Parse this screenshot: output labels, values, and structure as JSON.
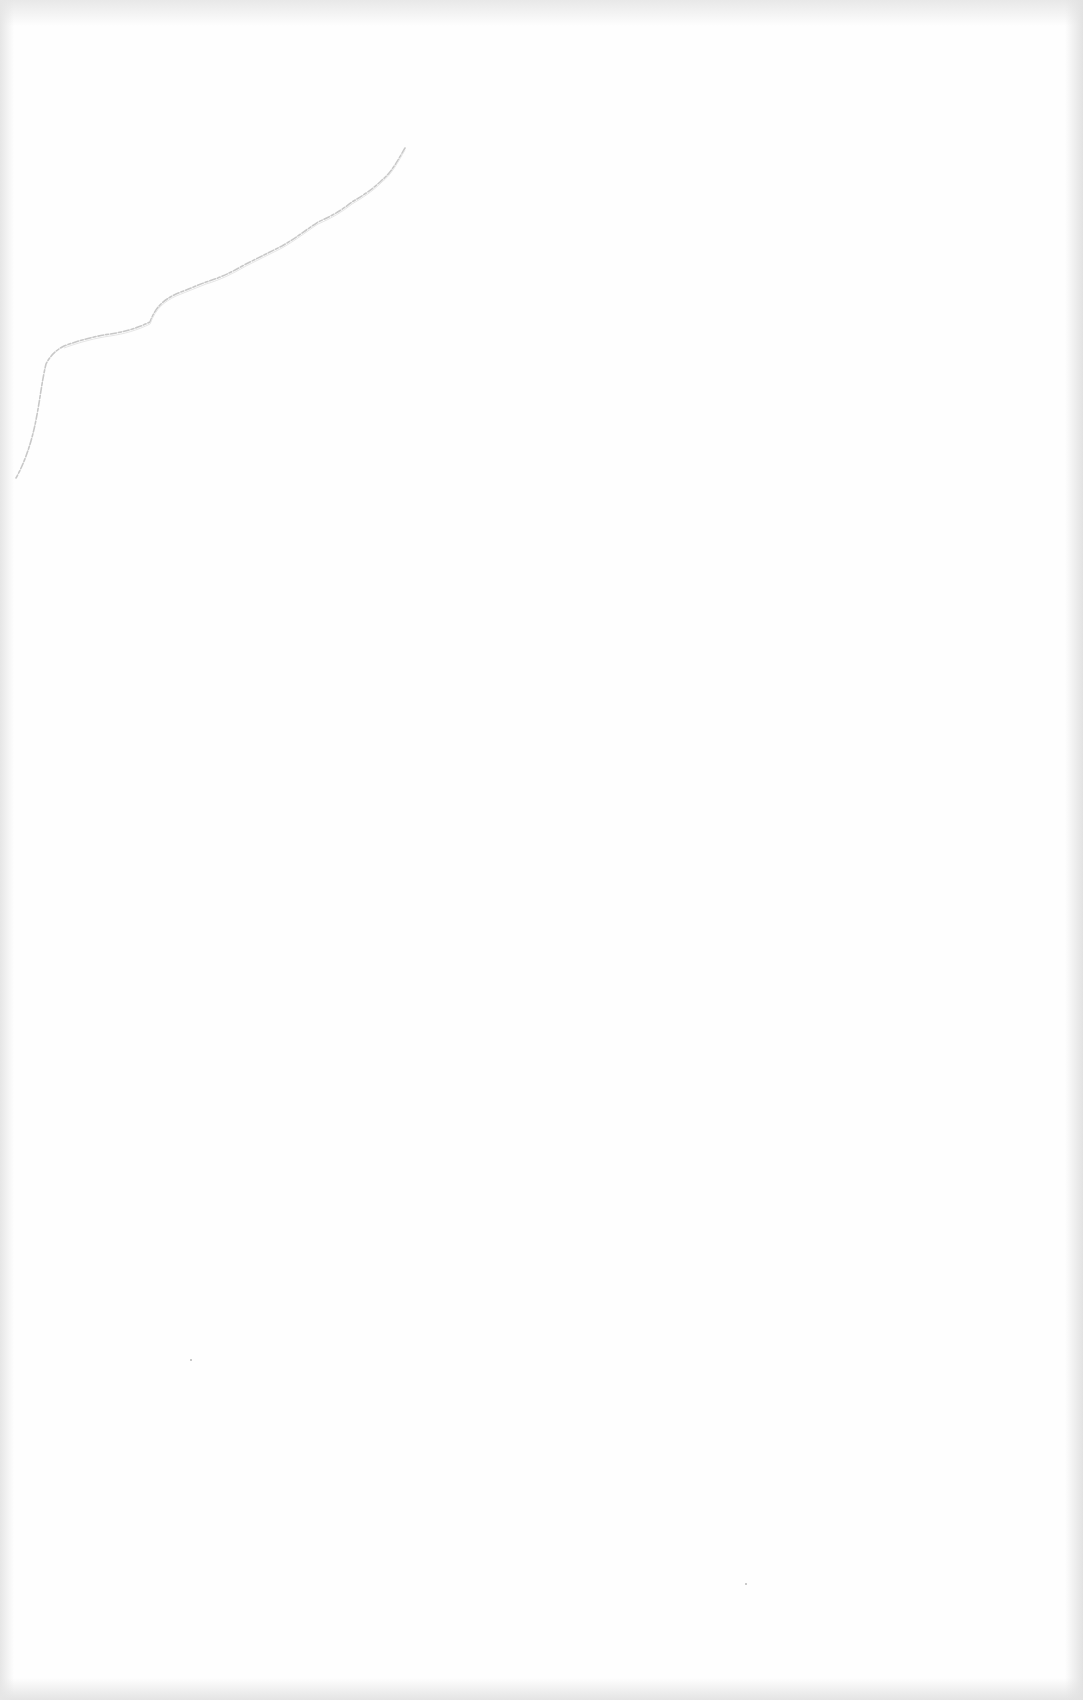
{
  "document": {
    "type": "blank scanned page",
    "content": "",
    "colors": {
      "paper": "#fefefe",
      "crease": "#c8c8c8",
      "edge_shadow": "#e4e4e4"
    },
    "artifacts": [
      {
        "kind": "tear-crease",
        "region": "top-left"
      },
      {
        "kind": "speck",
        "x": 190,
        "y": 1359
      },
      {
        "kind": "speck",
        "x": 745,
        "y": 1583
      }
    ]
  }
}
